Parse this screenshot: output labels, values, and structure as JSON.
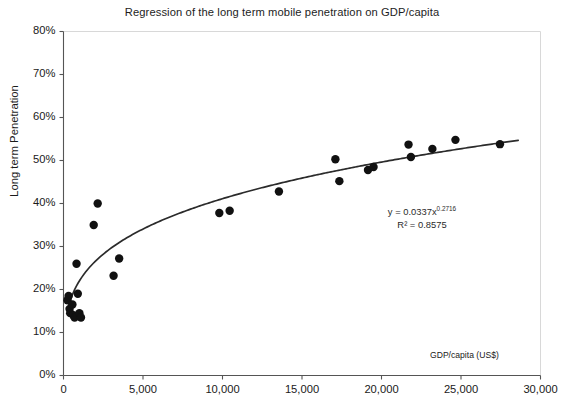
{
  "chart_data": {
    "type": "scatter",
    "title": "Regression of the long term mobile penetration on GDP/capita",
    "xlabel": "GDP/capita (US$)",
    "ylabel": "Long term Penetration",
    "xlim": [
      0,
      30000
    ],
    "ylim": [
      0,
      0.8
    ],
    "grid": false,
    "legend": null,
    "x_tick_labels": [
      "0",
      "5,000",
      "10,000",
      "15,000",
      "20,000",
      "25,000",
      "30,000"
    ],
    "x_tick_values": [
      0,
      5000,
      10000,
      15000,
      20000,
      25000,
      30000
    ],
    "y_tick_labels": [
      "0%",
      "10%",
      "20%",
      "30%",
      "40%",
      "50%",
      "60%",
      "70%",
      "80%"
    ],
    "y_tick_values": [
      0,
      0.1,
      0.2,
      0.3,
      0.4,
      0.5,
      0.6,
      0.7,
      0.8
    ],
    "marker_color": "#111111",
    "curve_color": "#2b2b2b",
    "axis_color": "#555555",
    "points": [
      {
        "x": 250,
        "y": 0.175
      },
      {
        "x": 320,
        "y": 0.185
      },
      {
        "x": 380,
        "y": 0.155
      },
      {
        "x": 420,
        "y": 0.145
      },
      {
        "x": 560,
        "y": 0.165
      },
      {
        "x": 620,
        "y": 0.14
      },
      {
        "x": 700,
        "y": 0.135
      },
      {
        "x": 820,
        "y": 0.26
      },
      {
        "x": 900,
        "y": 0.19
      },
      {
        "x": 1000,
        "y": 0.145
      },
      {
        "x": 1100,
        "y": 0.135
      },
      {
        "x": 1900,
        "y": 0.35
      },
      {
        "x": 2150,
        "y": 0.4
      },
      {
        "x": 3150,
        "y": 0.232
      },
      {
        "x": 3500,
        "y": 0.272
      },
      {
        "x": 9800,
        "y": 0.378
      },
      {
        "x": 10450,
        "y": 0.383
      },
      {
        "x": 13550,
        "y": 0.428
      },
      {
        "x": 17100,
        "y": 0.503
      },
      {
        "x": 17350,
        "y": 0.452
      },
      {
        "x": 19150,
        "y": 0.478
      },
      {
        "x": 19500,
        "y": 0.485
      },
      {
        "x": 21700,
        "y": 0.537
      },
      {
        "x": 21850,
        "y": 0.508
      },
      {
        "x": 23200,
        "y": 0.527
      },
      {
        "x": 24650,
        "y": 0.548
      },
      {
        "x": 27450,
        "y": 0.538
      }
    ],
    "trendline": {
      "type": "power",
      "coefficient": 0.0337,
      "exponent": 0.2716,
      "r_squared": 0.8575,
      "equation_text": "y = 0.0337x",
      "equation_exponent": "0.2716",
      "r2_text": "R² = 0.8575"
    }
  }
}
